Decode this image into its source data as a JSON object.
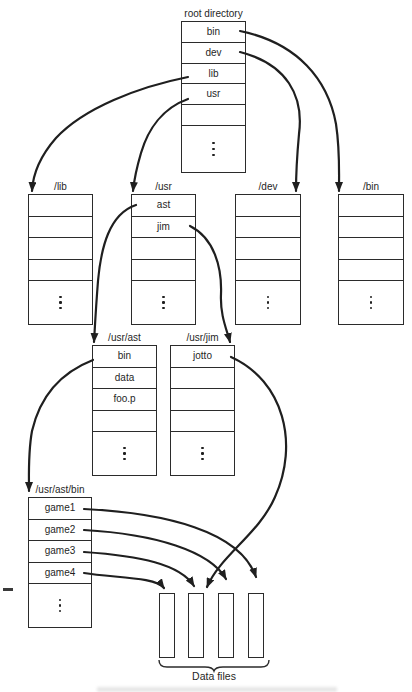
{
  "figure": {
    "tables": {
      "root": {
        "label": "root directory",
        "cells": [
          "bin",
          "dev",
          "lib",
          "usr",
          ""
        ]
      },
      "lib": {
        "label": "/lib",
        "cells": [
          "",
          "",
          "",
          ""
        ]
      },
      "usr": {
        "label": "/usr",
        "cells": [
          "ast",
          "jim",
          "",
          ""
        ]
      },
      "dev": {
        "label": "/dev",
        "cells": [
          "",
          "",
          "",
          ""
        ]
      },
      "bin": {
        "label": "/bin",
        "cells": [
          "",
          "",
          "",
          ""
        ]
      },
      "usr_ast": {
        "label": "/usr/ast",
        "cells": [
          "bin",
          "data",
          "foo.p",
          ""
        ]
      },
      "usr_jim": {
        "label": "/usr/jim",
        "cells": [
          "jotto",
          "",
          "",
          ""
        ]
      },
      "usr_ast_bin": {
        "label": "/usr/ast/bin",
        "cells": [
          "game1",
          "game2",
          "game3",
          "game4"
        ]
      }
    },
    "data_files": {
      "label": "Data files",
      "count": 4
    },
    "connections": [
      {
        "from": "root.bin",
        "to": "/bin"
      },
      {
        "from": "root.dev",
        "to": "/dev"
      },
      {
        "from": "root.lib",
        "to": "/lib"
      },
      {
        "from": "root.usr",
        "to": "/usr"
      },
      {
        "from": "usr.ast",
        "to": "/usr/ast"
      },
      {
        "from": "usr.jim",
        "to": "/usr/jim"
      },
      {
        "from": "usr_ast.bin",
        "to": "/usr/ast/bin"
      },
      {
        "from": "usr_jim.jotto",
        "to": "data-file-2"
      },
      {
        "from": "usr_ast_bin.game1",
        "to": "data-file-4"
      },
      {
        "from": "usr_ast_bin.game2",
        "to": "data-file-3"
      },
      {
        "from": "usr_ast_bin.game3",
        "to": "data-file-2"
      },
      {
        "from": "usr_ast_bin.game4",
        "to": "data-file-1"
      }
    ],
    "colors": {
      "ink": "#1f1f1f",
      "line": "#2b2b2b",
      "background": "#ffffff"
    }
  }
}
